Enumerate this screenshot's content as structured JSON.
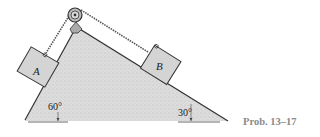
{
  "figure": {
    "caption": "Prob. 13–17",
    "block_a_label": "A",
    "block_b_label": "B",
    "angle_left": "60°",
    "angle_right": "30°"
  },
  "colors": {
    "wedge_fill": "#d9d9d9",
    "block_fill": "#d4d4d4",
    "stroke": "#333333",
    "caption": "#8a8a8a"
  }
}
